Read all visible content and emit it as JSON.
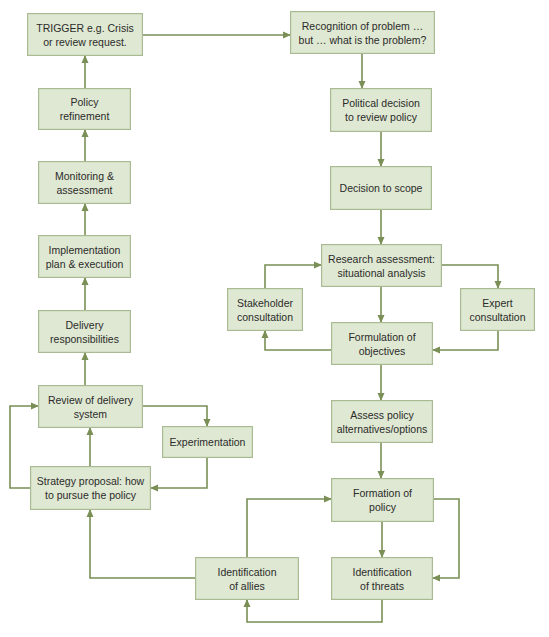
{
  "diagram": {
    "type": "policy-cycle-flowchart",
    "colors": {
      "box_fill": "#dfe8d2",
      "box_border": "#a9bb92",
      "connector": "#7a8f55",
      "text": "#2b2b2b"
    },
    "nodes": [
      {
        "id": "trigger",
        "label": "TRIGGER e.g. Crisis\nor review request.",
        "x": 27,
        "y": 13,
        "w": 116,
        "h": 43
      },
      {
        "id": "policy_refinement",
        "label": "Policy\nrefinement",
        "x": 38,
        "y": 88,
        "w": 93,
        "h": 42
      },
      {
        "id": "monitoring",
        "label": "Monitoring &\nassessment",
        "x": 38,
        "y": 161,
        "w": 93,
        "h": 43
      },
      {
        "id": "implementation",
        "label": "Implementation\nplan & execution",
        "x": 38,
        "y": 235,
        "w": 93,
        "h": 43
      },
      {
        "id": "delivery",
        "label": "Delivery\nresponsibilities",
        "x": 38,
        "y": 310,
        "w": 93,
        "h": 43
      },
      {
        "id": "review_delivery",
        "label": "Review of delivery\nsystem",
        "x": 38,
        "y": 385,
        "w": 105,
        "h": 43
      },
      {
        "id": "experimentation",
        "label": "Experimentation",
        "x": 162,
        "y": 426,
        "w": 91,
        "h": 32
      },
      {
        "id": "strategy",
        "label": "Strategy proposal: how\nto pursue the policy",
        "x": 30,
        "y": 466,
        "w": 121,
        "h": 44
      },
      {
        "id": "recognition",
        "label": "Recognition of problem …\nbut  … what is the problem?",
        "x": 290,
        "y": 11,
        "w": 145,
        "h": 43
      },
      {
        "id": "political",
        "label": "Political decision\nto review policy",
        "x": 330,
        "y": 88,
        "w": 102,
        "h": 44
      },
      {
        "id": "scope",
        "label": "Decision to scope",
        "x": 330,
        "y": 166,
        "w": 102,
        "h": 44
      },
      {
        "id": "research",
        "label": "Research assessment:\nsituational analysis",
        "x": 321,
        "y": 244,
        "w": 121,
        "h": 43
      },
      {
        "id": "stakeholder",
        "label": "Stakeholder\nconsultation",
        "x": 227,
        "y": 288,
        "w": 76,
        "h": 43
      },
      {
        "id": "expert",
        "label": "Expert\nconsultation",
        "x": 460,
        "y": 288,
        "w": 75,
        "h": 43
      },
      {
        "id": "objectives",
        "label": "Formulation of\nobjectives",
        "x": 331,
        "y": 322,
        "w": 102,
        "h": 43
      },
      {
        "id": "assess",
        "label": "Assess policy\nalternatives/options",
        "x": 331,
        "y": 400,
        "w": 102,
        "h": 43
      },
      {
        "id": "formation",
        "label": "Formation of\npolicy",
        "x": 331,
        "y": 478,
        "w": 103,
        "h": 44
      },
      {
        "id": "allies",
        "label": "Identification\nof allies",
        "x": 195,
        "y": 557,
        "w": 104,
        "h": 43
      },
      {
        "id": "threats",
        "label": "Identification\nof threats",
        "x": 331,
        "y": 557,
        "w": 102,
        "h": 43
      }
    ],
    "edges": [
      {
        "from": "trigger",
        "to": "recognition",
        "points": [
          [
            143,
            35
          ],
          [
            290,
            35
          ]
        ]
      },
      {
        "from": "recognition",
        "to": "political",
        "points": [
          [
            362,
            54
          ],
          [
            362,
            88
          ]
        ]
      },
      {
        "from": "political",
        "to": "scope",
        "points": [
          [
            381,
            132
          ],
          [
            381,
            166
          ]
        ]
      },
      {
        "from": "scope",
        "to": "research",
        "points": [
          [
            381,
            210
          ],
          [
            381,
            244
          ]
        ]
      },
      {
        "from": "research",
        "to": "objectives",
        "points": [
          [
            381,
            287
          ],
          [
            381,
            322
          ]
        ]
      },
      {
        "from": "research",
        "to": "expert",
        "points": [
          [
            442,
            265
          ],
          [
            498,
            265
          ],
          [
            498,
            288
          ]
        ]
      },
      {
        "from": "expert",
        "to": "objectives",
        "points": [
          [
            498,
            331
          ],
          [
            498,
            350
          ],
          [
            433,
            350
          ]
        ]
      },
      {
        "from": "objectives",
        "to": "stakeholder",
        "points": [
          [
            331,
            350
          ],
          [
            265,
            350
          ],
          [
            265,
            331
          ]
        ]
      },
      {
        "from": "stakeholder",
        "to": "research",
        "points": [
          [
            265,
            288
          ],
          [
            265,
            265
          ],
          [
            321,
            265
          ]
        ]
      },
      {
        "from": "objectives",
        "to": "assess",
        "points": [
          [
            381,
            365
          ],
          [
            381,
            400
          ]
        ]
      },
      {
        "from": "assess",
        "to": "formation",
        "points": [
          [
            381,
            443
          ],
          [
            381,
            478
          ]
        ]
      },
      {
        "from": "formation",
        "to": "threats",
        "points": [
          [
            382,
            522
          ],
          [
            382,
            557
          ]
        ]
      },
      {
        "from": "formation",
        "to": "threats",
        "points": [
          [
            434,
            499
          ],
          [
            459,
            499
          ],
          [
            459,
            578
          ],
          [
            433,
            578
          ]
        ]
      },
      {
        "from": "threats",
        "to": "allies",
        "points": [
          [
            382,
            600
          ],
          [
            382,
            622
          ],
          [
            247,
            622
          ],
          [
            247,
            600
          ]
        ]
      },
      {
        "from": "allies",
        "to": "formation",
        "points": [
          [
            247,
            557
          ],
          [
            247,
            499
          ],
          [
            331,
            499
          ]
        ]
      },
      {
        "from": "allies",
        "to": "strategy",
        "points": [
          [
            195,
            578
          ],
          [
            90,
            578
          ],
          [
            90,
            510
          ]
        ]
      },
      {
        "from": "strategy",
        "to": "review_delivery",
        "points": [
          [
            90,
            466
          ],
          [
            90,
            428
          ]
        ]
      },
      {
        "from": "strategy",
        "to": "review_delivery",
        "points": [
          [
            30,
            488
          ],
          [
            10,
            488
          ],
          [
            10,
            406
          ],
          [
            38,
            406
          ]
        ]
      },
      {
        "from": "review_delivery",
        "to": "experimentation",
        "points": [
          [
            143,
            406
          ],
          [
            207,
            406
          ],
          [
            207,
            426
          ]
        ]
      },
      {
        "from": "experimentation",
        "to": "strategy",
        "points": [
          [
            207,
            458
          ],
          [
            207,
            488
          ],
          [
            151,
            488
          ]
        ]
      },
      {
        "from": "review_delivery",
        "to": "delivery",
        "points": [
          [
            85,
            385
          ],
          [
            85,
            353
          ]
        ]
      },
      {
        "from": "delivery",
        "to": "implementation",
        "points": [
          [
            85,
            310
          ],
          [
            85,
            278
          ]
        ]
      },
      {
        "from": "implementation",
        "to": "monitoring",
        "points": [
          [
            85,
            235
          ],
          [
            85,
            204
          ]
        ]
      },
      {
        "from": "monitoring",
        "to": "policy_refinement",
        "points": [
          [
            85,
            161
          ],
          [
            85,
            130
          ]
        ]
      },
      {
        "from": "policy_refinement",
        "to": "trigger",
        "points": [
          [
            85,
            88
          ],
          [
            85,
            56
          ]
        ]
      }
    ]
  }
}
